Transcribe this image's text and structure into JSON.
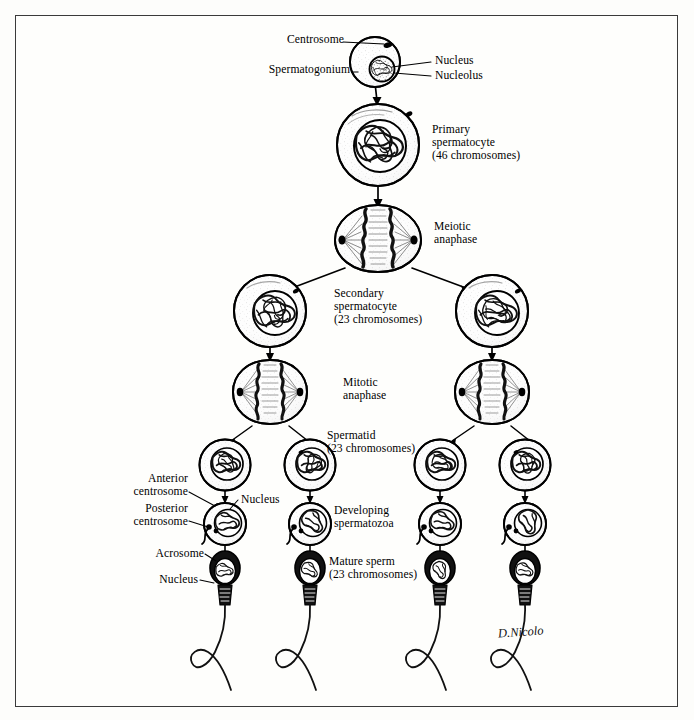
{
  "figure": {
    "signature": "D.Nicolo",
    "border_color": "#3a3a3a",
    "ink_color": "#000000",
    "background_color": "#fdfdfb"
  },
  "labels": {
    "centrosome": "Centrosome",
    "spermatogonium": "Spermatogonium",
    "nucleus_top": "Nucleus",
    "nucleolus": "Nucleolus",
    "primary_spermatocyte": "Primary\nspermatocyte\n(46 chromosomes)",
    "meiotic_anaphase": "Meiotic\nanaphase",
    "secondary_spermatocyte": "Secondary\nspermatocyte\n(23 chromosomes)",
    "mitotic_anaphase": "Mitotic\nanaphase",
    "spermatid": "Spermatid\n(23 chromosomes)",
    "anterior_centrosome": "Anterior\ncentrosome",
    "posterior_centrosome": "Posterior\ncentrosome",
    "nucleus_spermatid": "Nucleus",
    "developing_spermatozoa": "Developing\nspermatozoa",
    "acrosome": "Acrosome",
    "nucleus_sperm": "Nucleus",
    "mature_sperm": "Mature sperm\n(23 chromosomes)"
  },
  "stages": [
    {
      "name": "spermatogonium",
      "chromosomes": null,
      "count": 1
    },
    {
      "name": "primary spermatocyte",
      "chromosomes": 46,
      "count": 1
    },
    {
      "name": "meiotic anaphase",
      "chromosomes": 46,
      "count": 1
    },
    {
      "name": "secondary spermatocyte",
      "chromosomes": 23,
      "count": 2
    },
    {
      "name": "mitotic anaphase",
      "chromosomes": 23,
      "count": 2
    },
    {
      "name": "spermatid",
      "chromosomes": 23,
      "count": 4
    },
    {
      "name": "developing spermatozoa",
      "chromosomes": 23,
      "count": 4
    },
    {
      "name": "mature sperm",
      "chromosomes": 23,
      "count": 4
    }
  ]
}
